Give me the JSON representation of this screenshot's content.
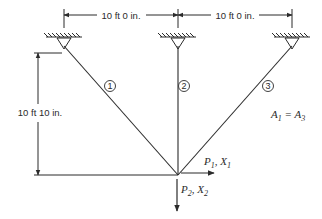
{
  "diagram": {
    "type": "three-bar truss",
    "dimensions": {
      "horizontal_left": "10 ft 0 in.",
      "horizontal_right": "10 ft 0 in.",
      "vertical": "10 ft 10 in."
    },
    "members": [
      {
        "id": "1",
        "label": "1"
      },
      {
        "id": "2",
        "label": "2"
      },
      {
        "id": "3",
        "label": "3"
      }
    ],
    "loads": {
      "p1": {
        "P": "P",
        "P_sub": "1",
        "X": "X",
        "X_sub": "1"
      },
      "p2": {
        "P": "P",
        "P_sub": "2",
        "X": "X",
        "X_sub": "2"
      }
    },
    "area_note": {
      "A_left": "A",
      "A_left_sub": "1",
      "eq": " = ",
      "A_right": "A",
      "A_right_sub": "3"
    },
    "colors": {
      "ink": "#2b2b2b",
      "background": "#ffffff"
    }
  }
}
